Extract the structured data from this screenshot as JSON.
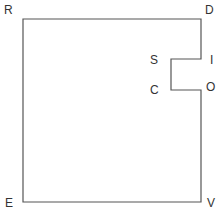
{
  "diagram": {
    "type": "polygon-with-notch",
    "stroke_color": "#555555",
    "vertices": [
      {
        "label": "R",
        "x": 23,
        "y": 19
      },
      {
        "label": "D",
        "x": 201,
        "y": 19
      },
      {
        "label": "I",
        "x": 201,
        "y": 59
      },
      {
        "label": "S",
        "x": 171,
        "y": 59
      },
      {
        "label": "C",
        "x": 171,
        "y": 90
      },
      {
        "label": "O",
        "x": 201,
        "y": 90
      },
      {
        "label": "V",
        "x": 201,
        "y": 202
      },
      {
        "label": "E",
        "x": 23,
        "y": 202
      }
    ],
    "labels": {
      "r": "R",
      "d": "D",
      "i": "I",
      "s": "S",
      "c": "C",
      "o": "O",
      "v": "V",
      "e": "E"
    }
  }
}
